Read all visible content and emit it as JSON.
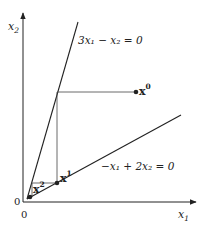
{
  "diagram": {
    "title": "",
    "axes": {
      "x_label": "x",
      "x_label_sub": "1",
      "y_label": "x",
      "y_label_sub": "2",
      "origin_x_label": "0",
      "origin_y_label": "0"
    },
    "lines": [
      {
        "id": "constraint-steep",
        "equation": "3x₁ − x₂ = 0"
      },
      {
        "id": "constraint-shallow",
        "equation": "−x₁ + 2x₂ = 0"
      }
    ],
    "points": [
      {
        "id": "x0",
        "label": "x",
        "superscript": "0"
      },
      {
        "id": "x1",
        "label": "x",
        "superscript": "1"
      },
      {
        "id": "x2",
        "label": "x",
        "superscript": "2"
      }
    ],
    "colors": {
      "ink": "#222222"
    }
  }
}
